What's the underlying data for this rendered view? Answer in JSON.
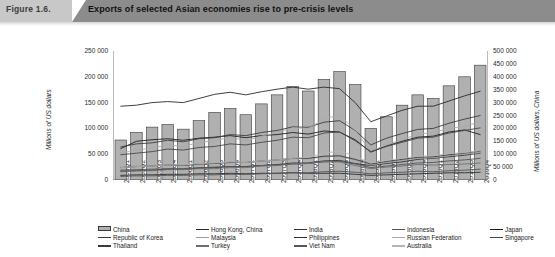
{
  "figure": {
    "number_label": "Figure 1.6.",
    "title": "Exports of selected Asian economies rise to pre-crisis levels"
  },
  "axes": {
    "left_title": "Millions of US dollars",
    "right_title": "Millions of US dollars, China",
    "left_ticks": [
      "250 000",
      "200 000",
      "150 000",
      "100 000",
      "50 000",
      "0"
    ],
    "right_ticks": [
      "500 000",
      "450 000",
      "400 000",
      "350 000",
      "300 000",
      "250 000",
      "200 000",
      "150 000",
      "100 000",
      "50 000",
      "0"
    ]
  },
  "colors": {
    "bar_fill": "#b0b0b0",
    "bar_stroke": "#3a3a3a",
    "banner_left": "#c8c8c8",
    "banner_right": "#8c8c8c",
    "axis": "#6a6a6a",
    "line_dark": "#1a1a1a",
    "line_mid": "#4a4a4a",
    "line_light": "#9a9a9a"
  },
  "chart_data": {
    "type": "bar",
    "title": "Exports of selected Asian economies rise to pre-crisis levels",
    "xlabel": "",
    "ylabel": "Millions of US dollars",
    "ylabel_secondary": "Millions of US dollars, China",
    "ylim": [
      0,
      250000
    ],
    "ylim_secondary": [
      0,
      500000
    ],
    "grid": false,
    "legend_position": "bottom",
    "categories": [
      "2005Q1",
      "2005Q2",
      "2005Q3",
      "2005Q4",
      "2006Q1",
      "2006Q2",
      "2006Q3",
      "2006Q4",
      "2007Q1",
      "2007Q2",
      "2007Q3",
      "2007Q4",
      "2008Q1",
      "2008Q2",
      "2008Q3",
      "2008Q4",
      "2009Q1",
      "2009Q2",
      "2009Q3",
      "2009Q4",
      "2010Q1",
      "2010Q2",
      "2010Q3",
      "2010Q4"
    ],
    "series": [
      {
        "name": "China",
        "render": "bar",
        "axis": "secondary",
        "color": "#b0b0b0",
        "values": [
          155000,
          185000,
          205000,
          215000,
          197000,
          230000,
          262000,
          277000,
          253000,
          295000,
          330000,
          362000,
          345000,
          390000,
          420000,
          370000,
          200000,
          245000,
          290000,
          330000,
          316000,
          365000,
          400000,
          445000
        ]
      },
      {
        "name": "Hong Kong, China",
        "render": "line",
        "axis": "primary",
        "color": "#2a2a2a",
        "values": [
          143000,
          145000,
          150000,
          152000,
          150000,
          158000,
          166000,
          170000,
          165000,
          171000,
          176000,
          180000,
          176000,
          180000,
          177000,
          150000,
          113000,
          124000,
          135000,
          143000,
          143000,
          153000,
          163000,
          172000
        ]
      },
      {
        "name": "India",
        "render": "line",
        "axis": "primary",
        "color": "#333333",
        "values": [
          17000,
          18000,
          19000,
          21000,
          21000,
          23000,
          24000,
          26000,
          26000,
          28000,
          30000,
          33000,
          33000,
          37000,
          38000,
          32000,
          28000,
          32000,
          35000,
          40000,
          42000,
          45000,
          48000,
          52000
        ]
      },
      {
        "name": "Indonesia",
        "render": "line",
        "axis": "primary",
        "color": "#555555",
        "values": [
          19000,
          20000,
          21000,
          22000,
          22000,
          24000,
          25000,
          26000,
          26000,
          28000,
          29000,
          31000,
          32000,
          35000,
          36000,
          31000,
          24000,
          27000,
          30000,
          33000,
          34000,
          37000,
          39000,
          42000
        ]
      },
      {
        "name": "Japan",
        "render": "line",
        "axis": "primary",
        "color": "#1f1f1f",
        "values": [
          61000,
          75000,
          78000,
          80000,
          77000,
          81000,
          83000,
          86000,
          82000,
          86000,
          88000,
          92000,
          89000,
          95000,
          93000,
          78000,
          54000,
          66000,
          75000,
          83000,
          85000,
          93000,
          97000,
          88000
        ]
      },
      {
        "name": "Republic of Korea",
        "render": "line",
        "axis": "primary",
        "color": "#3d3d3d",
        "values": [
          64000,
          70000,
          72000,
          77000,
          74000,
          80000,
          82000,
          88000,
          86000,
          92000,
          96000,
          103000,
          102000,
          112000,
          115000,
          96000,
          68000,
          81000,
          90000,
          98000,
          100000,
          110000,
          118000,
          125000
        ]
      },
      {
        "name": "Malaysia",
        "render": "line",
        "axis": "primary",
        "color": "#9e9e9e",
        "values": [
          25000,
          27000,
          28000,
          30000,
          29000,
          32000,
          33000,
          35000,
          34000,
          36000,
          38000,
          41000,
          41000,
          45000,
          46000,
          38000,
          29000,
          34000,
          38000,
          42000,
          43000,
          47000,
          50000,
          53000
        ]
      },
      {
        "name": "Philippines",
        "render": "line",
        "axis": "primary",
        "color": "#2e2e2e",
        "values": [
          9000,
          10000,
          10000,
          11000,
          11000,
          12000,
          12000,
          13000,
          12000,
          13000,
          13000,
          14000,
          13000,
          13000,
          13000,
          11000,
          9000,
          10000,
          11000,
          12000,
          13000,
          14000,
          14000,
          15000
        ]
      },
      {
        "name": "Russian Federation",
        "render": "line",
        "axis": "primary",
        "color": "#aaaaaa",
        "values": [
          52000,
          58000,
          62000,
          68000,
          65000,
          73000,
          76000,
          83000,
          76000,
          85000,
          92000,
          101000,
          100000,
          118000,
          126000,
          96000,
          56000,
          68000,
          78000,
          89000,
          92000,
          100000,
          104000,
          113000
        ]
      },
      {
        "name": "Singapore",
        "render": "line",
        "axis": "primary",
        "color": "#474747",
        "values": [
          49000,
          52000,
          55000,
          60000,
          58000,
          63000,
          65000,
          70000,
          68000,
          73000,
          77000,
          83000,
          82000,
          91000,
          93000,
          76000,
          55000,
          65000,
          73000,
          81000,
          83000,
          91000,
          96000,
          101000
        ]
      },
      {
        "name": "Thailand",
        "render": "line",
        "axis": "primary",
        "color": "#3a3a3a",
        "values": [
          24000,
          26000,
          27000,
          29000,
          28000,
          31000,
          32000,
          34000,
          34000,
          37000,
          39000,
          42000,
          42000,
          46000,
          47000,
          40000,
          31000,
          36000,
          40000,
          44000,
          45000,
          49000,
          52000,
          56000
        ]
      },
      {
        "name": "Turkey",
        "render": "line",
        "axis": "primary",
        "color": "#6e6e6e",
        "values": [
          16000,
          18000,
          18000,
          20000,
          20000,
          22000,
          22000,
          24000,
          24000,
          27000,
          28000,
          31000,
          32000,
          36000,
          35000,
          28000,
          22000,
          25000,
          27000,
          30000,
          29000,
          30000,
          31000,
          33000
        ]
      },
      {
        "name": "Viet Nam",
        "render": "line",
        "axis": "primary",
        "color": "#565656",
        "values": [
          7000,
          8000,
          8000,
          9000,
          9000,
          10000,
          10000,
          11000,
          11000,
          12000,
          13000,
          14000,
          14000,
          16000,
          17000,
          15000,
          12000,
          14000,
          15000,
          17000,
          16000,
          18000,
          19000,
          21000
        ]
      },
      {
        "name": "Australia",
        "render": "line",
        "axis": "primary",
        "color": "#b5b5b5",
        "values": [
          24000,
          26000,
          27000,
          29000,
          29000,
          32000,
          33000,
          35000,
          34000,
          37000,
          39000,
          42000,
          44000,
          52000,
          56000,
          46000,
          33000,
          38000,
          42000,
          46000,
          47000,
          51000,
          53000,
          57000
        ]
      }
    ]
  },
  "legend": {
    "items": [
      {
        "label": "China",
        "swatch": "bar",
        "color": "#b0b0b0"
      },
      {
        "label": "Hong Kong, China",
        "swatch": "line",
        "color": "#2a2a2a"
      },
      {
        "label": "India",
        "swatch": "line",
        "color": "#333333"
      },
      {
        "label": "Indonesia",
        "swatch": "line",
        "color": "#555555"
      },
      {
        "label": "Japan",
        "swatch": "line",
        "color": "#1f1f1f"
      },
      {
        "label": "Republic of Korea",
        "swatch": "line",
        "color": "#3d3d3d"
      },
      {
        "label": "Malaysia",
        "swatch": "line",
        "color": "#9e9e9e"
      },
      {
        "label": "Philippines",
        "swatch": "line",
        "color": "#2e2e2e"
      },
      {
        "label": "Russian Federation",
        "swatch": "line",
        "color": "#aaaaaa"
      },
      {
        "label": "Singapore",
        "swatch": "line",
        "color": "#474747"
      },
      {
        "label": "Thailand",
        "swatch": "line",
        "color": "#3a3a3a"
      },
      {
        "label": "Turkey",
        "swatch": "line",
        "color": "#6e6e6e"
      },
      {
        "label": "Viet Nam",
        "swatch": "line",
        "color": "#565656"
      },
      {
        "label": "Australia",
        "swatch": "line",
        "color": "#b5b5b5"
      }
    ]
  }
}
